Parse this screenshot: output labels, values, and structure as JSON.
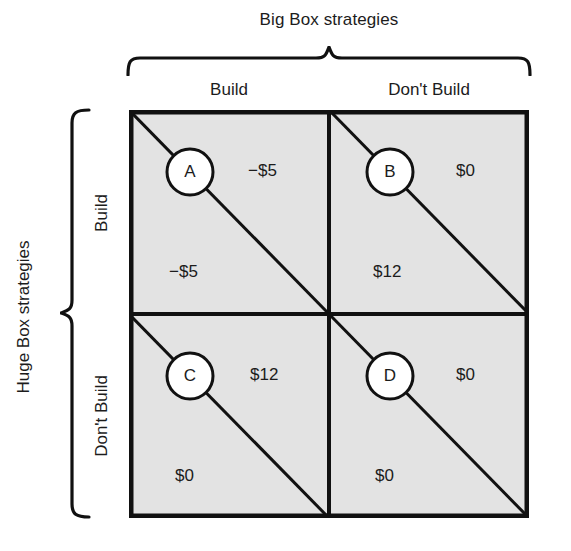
{
  "column_group": {
    "label": "Big Box strategies",
    "headers": [
      "Build",
      "Don't Build"
    ]
  },
  "row_group": {
    "label": "Huge Box strategies",
    "headers": [
      "Build",
      "Don't Build"
    ]
  },
  "colors": {
    "cell_fill": "#e3e3e3",
    "stroke": "#111111",
    "text": "#1c1c1c",
    "circle_fill": "#ffffff",
    "background": "#ffffff"
  },
  "matrix": {
    "cells": [
      {
        "id": "A",
        "row": "Build",
        "column": "Build",
        "upper_right_payoff": "−$5",
        "lower_left_payoff": "−$5"
      },
      {
        "id": "B",
        "row": "Build",
        "column": "Don't Build",
        "upper_right_payoff": "$0",
        "lower_left_payoff": "$12"
      },
      {
        "id": "C",
        "row": "Don't Build",
        "column": "Build",
        "upper_right_payoff": "$12",
        "lower_left_payoff": "$0"
      },
      {
        "id": "D",
        "row": "Don't Build",
        "column": "Don't Build",
        "upper_right_payoff": "$0",
        "lower_left_payoff": "$0"
      }
    ]
  }
}
